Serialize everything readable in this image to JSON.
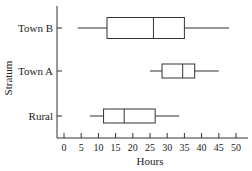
{
  "chart_data": {
    "type": "boxplot",
    "title": "",
    "xlabel": "Hours",
    "ylabel": "Stratum",
    "xlim": [
      0,
      50
    ],
    "x_ticks": [
      0,
      5,
      10,
      15,
      20,
      25,
      30,
      35,
      40,
      45,
      50
    ],
    "categories": [
      "Town B",
      "Town A",
      "Rural"
    ],
    "series": [
      {
        "name": "Town B",
        "min": 4,
        "q1": 12.5,
        "median": 26,
        "q3": 35,
        "max": 48
      },
      {
        "name": "Town A",
        "min": 25,
        "q1": 28.5,
        "median": 34.5,
        "q3": 38,
        "max": 45
      },
      {
        "name": "Rural",
        "min": 7.5,
        "q1": 11.5,
        "median": 17.5,
        "q3": 26.5,
        "max": 33.5
      }
    ],
    "grid": false,
    "legend": null
  }
}
